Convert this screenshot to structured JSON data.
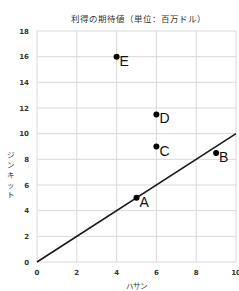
{
  "chart_data": {
    "type": "scatter",
    "title": "利得の期待値（単位：百万ドル）",
    "xlabel": "ハサン",
    "ylabel": "ジンキット",
    "xlim": [
      0,
      10
    ],
    "ylim": [
      0,
      18
    ],
    "x_ticks": [
      "0",
      "2",
      "4",
      "6",
      "8",
      "10"
    ],
    "y_ticks": [
      "0",
      "2",
      "4",
      "6",
      "8",
      "10",
      "12",
      "14",
      "16",
      "18"
    ],
    "grid": true,
    "legend": "none",
    "points": [
      {
        "label": "A",
        "x": 5,
        "y": 5
      },
      {
        "label": "B",
        "x": 9,
        "y": 8.5
      },
      {
        "label": "C",
        "x": 6,
        "y": 9
      },
      {
        "label": "D",
        "x": 6,
        "y": 11.5
      },
      {
        "label": "E",
        "x": 4,
        "y": 16
      }
    ],
    "line": {
      "x": [
        0,
        10
      ],
      "y": [
        0,
        10
      ],
      "description": "y = x"
    }
  },
  "colors": {
    "grid": "#d9d9d9",
    "line": "#1a1a1a",
    "point": "#000000",
    "text": "#333333"
  }
}
